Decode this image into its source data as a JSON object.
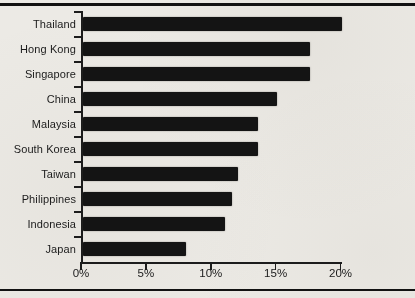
{
  "page": {
    "background_color": "#ECEAE5",
    "rule_color": "#121212"
  },
  "chart_data": {
    "type": "bar",
    "orientation": "horizontal",
    "title": "",
    "xlabel": "",
    "ylabel": "",
    "categories": [
      "Thailand",
      "Hong Kong",
      "Singapore",
      "China",
      "Malaysia",
      "South Korea",
      "Taiwan",
      "Philippines",
      "Indonesia",
      "Japan"
    ],
    "values": [
      20,
      17.5,
      17.5,
      15,
      13.5,
      13.5,
      12,
      11.5,
      11,
      8
    ],
    "value_unit": "percent",
    "x_axis": {
      "min": 0,
      "max": 20,
      "tick_values": [
        0,
        5,
        10,
        15,
        20
      ],
      "tick_labels": [
        "0%",
        "5%",
        "10%",
        "15%",
        "20%"
      ]
    },
    "grid": false,
    "legend": false,
    "bar_color": "#141414",
    "axis_color": "#1C1C1C",
    "text_color": "#1B1B1B"
  }
}
